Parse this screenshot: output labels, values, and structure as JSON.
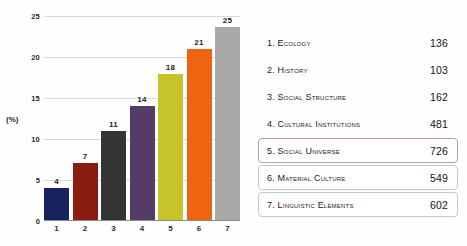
{
  "chart_data": {
    "type": "bar",
    "title": "",
    "xlabel": "",
    "ylabel": "(%)",
    "categories": [
      "1",
      "2",
      "3",
      "4",
      "5",
      "6",
      "7"
    ],
    "values": [
      4,
      7,
      11,
      14,
      18,
      21,
      25
    ],
    "ylim": [
      0,
      25
    ],
    "yticks": [
      "0",
      "5",
      "10",
      "15",
      "20",
      "25"
    ],
    "grid": true,
    "legend_position": "right",
    "bar_colors": [
      "#17235c",
      "#8b1d10",
      "#343434",
      "#553c66",
      "#c5c42b",
      "#ef6410",
      "#a8a8a8"
    ],
    "series": [
      {
        "name": "Percentage",
        "values": [
          4,
          7,
          11,
          14,
          18,
          21,
          25
        ]
      }
    ]
  },
  "chart": {
    "y_axis_title": "(%)",
    "y_ticks": [
      "25",
      "20",
      "15",
      "10",
      "5",
      "0"
    ],
    "x_ticks": [
      "1",
      "2",
      "3",
      "4",
      "5",
      "6",
      "7"
    ],
    "bars": [
      {
        "label": "1",
        "value": 4,
        "value_text": "4",
        "color": "#17235c"
      },
      {
        "label": "2",
        "value": 7,
        "value_text": "7",
        "color": "#8b1d10"
      },
      {
        "label": "3",
        "value": 11,
        "value_text": "11",
        "color": "#343434"
      },
      {
        "label": "4",
        "value": 14,
        "value_text": "14",
        "color": "#553c66"
      },
      {
        "label": "5",
        "value": 18,
        "value_text": "18",
        "color": "#c5c42b"
      },
      {
        "label": "6",
        "value": 21,
        "value_text": "21",
        "color": "#ef6410"
      },
      {
        "label": "7",
        "value": 25,
        "value_text": "25",
        "color": "#a8a8a8"
      }
    ]
  },
  "legend": {
    "items": [
      {
        "label": "1. Ecology",
        "value": "136",
        "highlight": "none"
      },
      {
        "label": "2. History",
        "value": "103",
        "highlight": "none"
      },
      {
        "label": "3. Social Structure",
        "value": "162",
        "highlight": "none"
      },
      {
        "label": "4. Cultural Institutions",
        "value": "481",
        "highlight": "none"
      },
      {
        "label": "5. Social Universe",
        "value": "726",
        "highlight": "red"
      },
      {
        "label": "6. Material Culture",
        "value": "549",
        "highlight": "blue"
      },
      {
        "label": "7. Linguistic Elements",
        "value": "602",
        "highlight": "blue"
      }
    ]
  },
  "colors": {
    "grid": "#d9d9d9",
    "axis": "#8d8d8d",
    "highlight_red": "#c99b92",
    "highlight_blue": "#bcccd6",
    "text": "#1a1a1a"
  }
}
